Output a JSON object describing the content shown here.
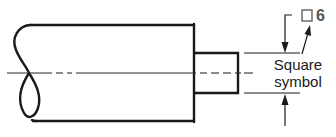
{
  "diagram": {
    "type": "engineering-drawing",
    "callout": {
      "symbol": "□",
      "value": "6"
    },
    "annotation": {
      "line1": "Square",
      "line2": "symbol"
    },
    "colors": {
      "line": "#1a1a1a",
      "thin": "#2a2a2a",
      "callout_text": "#555555",
      "background": "#ffffff"
    }
  }
}
